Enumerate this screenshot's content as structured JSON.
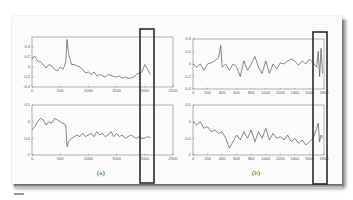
{
  "chart_data": [
    {
      "id": "a_top",
      "type": "line",
      "panel": "(a)",
      "title": "",
      "xlabel": "",
      "ylabel": "",
      "xlim": [
        0,
        2500
      ],
      "ylim": [
        -0.4,
        0.6
      ],
      "xticks": [
        "0",
        "500",
        "1000",
        "1500",
        "2000",
        "2500"
      ],
      "yticks": [
        "-0.4",
        "-0.2",
        "0",
        "0.2",
        "0.4"
      ],
      "grid": false,
      "x": [
        0,
        50,
        100,
        150,
        200,
        250,
        300,
        350,
        400,
        450,
        500,
        550,
        600,
        620,
        650,
        700,
        750,
        800,
        850,
        900,
        950,
        1000,
        1050,
        1100,
        1150,
        1200,
        1250,
        1300,
        1350,
        1400,
        1450,
        1500,
        1550,
        1600,
        1650,
        1700,
        1750,
        1800,
        1850,
        1900,
        1950,
        2000,
        2050,
        2100
      ],
      "values": [
        0.15,
        0.22,
        0.12,
        0.1,
        0.05,
        -0.02,
        0.05,
        0.02,
        -0.05,
        -0.08,
        0.0,
        -0.05,
        0.1,
        0.55,
        0.25,
        0.05,
        0.05,
        0.02,
        0.0,
        -0.05,
        -0.12,
        -0.1,
        -0.15,
        -0.1,
        -0.18,
        -0.15,
        -0.18,
        -0.2,
        -0.15,
        -0.17,
        -0.19,
        -0.2,
        -0.18,
        -0.22,
        -0.2,
        -0.23,
        -0.22,
        -0.2,
        -0.15,
        -0.12,
        -0.1,
        0.05,
        -0.05,
        -0.15
      ]
    },
    {
      "id": "a_bottom",
      "type": "line",
      "panel": "(a)",
      "title": "",
      "xlabel": "",
      "ylabel": "",
      "xlim": [
        0,
        2500
      ],
      "ylim": [
        -1,
        0.5
      ],
      "xticks": [
        "0",
        "500",
        "1000",
        "1500",
        "2000",
        "2500"
      ],
      "yticks": [
        "-1",
        "-0.5",
        "0",
        "0.5"
      ],
      "grid": false,
      "x": [
        0,
        50,
        100,
        150,
        200,
        250,
        300,
        350,
        400,
        450,
        500,
        550,
        600,
        620,
        650,
        700,
        750,
        800,
        850,
        900,
        950,
        1000,
        1050,
        1100,
        1150,
        1200,
        1250,
        1300,
        1350,
        1400,
        1450,
        1500,
        1550,
        1600,
        1650,
        1700,
        1750,
        1800,
        1850,
        1900,
        1950,
        2000,
        2050,
        2100
      ],
      "values": [
        -0.25,
        -0.15,
        0.0,
        0.1,
        0.05,
        -0.1,
        0.0,
        -0.05,
        0.1,
        0.05,
        0.0,
        -0.05,
        -0.1,
        -0.75,
        -0.6,
        -0.5,
        -0.45,
        -0.4,
        -0.45,
        -0.35,
        -0.45,
        -0.4,
        -0.35,
        -0.45,
        -0.3,
        -0.4,
        -0.35,
        -0.45,
        -0.4,
        -0.3,
        -0.45,
        -0.35,
        -0.45,
        -0.4,
        -0.5,
        -0.45,
        -0.4,
        -0.45,
        -0.5,
        -0.45,
        -0.5,
        -0.5,
        -0.45,
        -0.48
      ]
    },
    {
      "id": "b_top",
      "type": "line",
      "panel": "(b)",
      "title": "",
      "xlabel": "",
      "ylabel": "",
      "xlim": [
        0,
        1800
      ],
      "ylim": [
        -0.4,
        0.4
      ],
      "xticks": [
        "0",
        "200",
        "400",
        "600",
        "800",
        "1000",
        "1200",
        "1400",
        "1600",
        "1800"
      ],
      "yticks": [
        "-0.4",
        "-0.2",
        "0",
        "0.2",
        "0.4"
      ],
      "grid": false,
      "x": [
        0,
        50,
        100,
        150,
        200,
        250,
        300,
        350,
        380,
        400,
        450,
        500,
        550,
        600,
        650,
        700,
        750,
        800,
        850,
        900,
        950,
        1000,
        1050,
        1100,
        1150,
        1200,
        1250,
        1300,
        1350,
        1400,
        1450,
        1500,
        1550,
        1600,
        1650,
        1700,
        1720,
        1740,
        1760,
        1780
      ],
      "values": [
        0.0,
        -0.05,
        0.0,
        -0.1,
        0.0,
        0.02,
        0.05,
        0.1,
        0.3,
        -0.05,
        0.0,
        -0.1,
        0.0,
        -0.05,
        -0.2,
        0.05,
        -0.1,
        0.0,
        0.12,
        -0.05,
        -0.15,
        0.05,
        -0.15,
        0.0,
        -0.08,
        0.02,
        0.0,
        0.05,
        0.08,
        0.05,
        -0.02,
        0.05,
        0.0,
        0.08,
        0.02,
        -0.05,
        0.2,
        -0.2,
        0.25,
        -0.15
      ]
    },
    {
      "id": "b_bottom",
      "type": "line",
      "panel": "(b)",
      "title": "",
      "xlabel": "",
      "ylabel": "",
      "xlim": [
        0,
        1800
      ],
      "ylim": [
        -1,
        0.5
      ],
      "xticks": [
        "0",
        "200",
        "400",
        "600",
        "800",
        "1000",
        "1200",
        "1400",
        "1600",
        "1800"
      ],
      "yticks": [
        "-1",
        "-0.5",
        "0",
        "0.5"
      ],
      "grid": false,
      "x": [
        0,
        50,
        100,
        150,
        200,
        250,
        300,
        350,
        400,
        450,
        500,
        550,
        600,
        650,
        700,
        750,
        800,
        850,
        900,
        950,
        1000,
        1050,
        1100,
        1150,
        1200,
        1250,
        1300,
        1350,
        1400,
        1450,
        1500,
        1550,
        1600,
        1650,
        1700,
        1720,
        1740,
        1760,
        1780
      ],
      "values": [
        0.0,
        -0.1,
        0.0,
        -0.2,
        -0.15,
        -0.3,
        -0.25,
        -0.35,
        -0.3,
        -0.5,
        -0.8,
        -0.6,
        -0.4,
        -0.55,
        -0.3,
        -0.5,
        -0.25,
        -0.6,
        -0.3,
        -0.5,
        -0.2,
        -0.55,
        -0.35,
        -0.5,
        -0.45,
        -0.55,
        -0.4,
        -0.6,
        -0.5,
        -0.65,
        -0.55,
        -0.7,
        -0.6,
        -0.5,
        -0.2,
        -0.05,
        -0.6,
        -0.4,
        -0.5
      ]
    }
  ],
  "captions": {
    "left": "(a)",
    "right": "(b)"
  },
  "highlights": {
    "left_box_label": "highlighted region near x=2000 in (a)",
    "right_box_label": "highlighted region near x=1750 in (b)"
  },
  "colors": {
    "line": "#555555",
    "axes": "#666666",
    "highlight_box": "#2a2a2a",
    "paper": "#fbfbfb"
  }
}
